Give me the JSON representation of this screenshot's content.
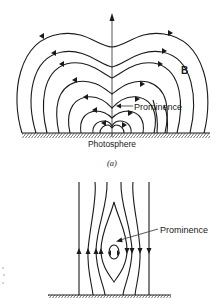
{
  "figure": {
    "panel_a": {
      "caption": "(a)",
      "field_label": "B",
      "prominence_label": "Prominence",
      "surface_label": "Photosphere"
    },
    "panel_b": {
      "prominence_label": "Prominence"
    }
  },
  "colors": {
    "ink": "#1a1a1a",
    "background": "#ffffff"
  }
}
